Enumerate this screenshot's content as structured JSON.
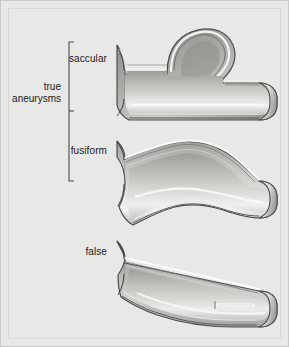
{
  "figure": {
    "background_color": "#e8e8e6",
    "border_color": "#c9c9c7",
    "ink_color": "#1b1b1b"
  },
  "group": {
    "label_line1": "true",
    "label_line2": "aneurysms",
    "bracket_name": "true-aneurysms-bracket"
  },
  "items": [
    {
      "id": "saccular",
      "label": "saccular",
      "type": "true-aneurysm",
      "description": "vessel with localized balloon-like outpouching of all wall layers"
    },
    {
      "id": "fusiform",
      "label": "fusiform",
      "type": "true-aneurysm",
      "description": "symmetric spindle-shaped dilation of the entire vessel circumference"
    },
    {
      "id": "false",
      "label": "false",
      "type": "pseudoaneurysm",
      "description": "contained rupture through a wall defect forming a sac outside the vessel wall"
    }
  ],
  "palette": {
    "vessel_light": "#f2f2f0",
    "vessel_mid": "#bdbdba",
    "vessel_dark": "#8a8a87",
    "outline": "#4a4a48",
    "lumen_highlight": "#fbfbfa"
  }
}
